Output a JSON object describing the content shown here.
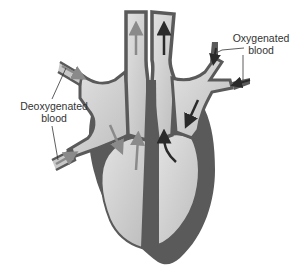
{
  "diagram": {
    "labels": {
      "deoxygenated": {
        "line1": "Deoxygenated",
        "line2": "blood"
      },
      "oxygenated": {
        "line1": "Oxygenated",
        "line2": "blood"
      }
    },
    "colors": {
      "wall": "#5a5a5a",
      "chamber": "#c8c8c8",
      "chamber_light": "#dcdcdc",
      "deoxy_arrow": "#8a8a8a",
      "oxy_arrow": "#2a2a2a",
      "leader_line": "#333333",
      "background": "#ffffff"
    }
  }
}
